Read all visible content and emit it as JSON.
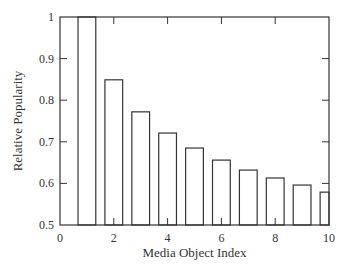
{
  "chart_data": {
    "type": "bar",
    "title": "",
    "xlabel": "Media Object Index",
    "ylabel": "Relative Popularity",
    "xlim": [
      0,
      10
    ],
    "ylim": [
      0.5,
      1
    ],
    "x_ticks": [
      "0",
      "2",
      "4",
      "6",
      "8",
      "10"
    ],
    "y_ticks": [
      "0.5",
      "0.6",
      "0.7",
      "0.8",
      "0.9",
      "1"
    ],
    "grid": false,
    "legend": null,
    "categories": [
      1,
      2,
      3,
      4,
      5,
      6,
      7,
      8,
      9,
      10
    ],
    "values": [
      1.0,
      0.849,
      0.772,
      0.721,
      0.685,
      0.656,
      0.632,
      0.613,
      0.596,
      0.579
    ],
    "bar_fill": "#ffffff",
    "bar_stroke": "#333333"
  }
}
